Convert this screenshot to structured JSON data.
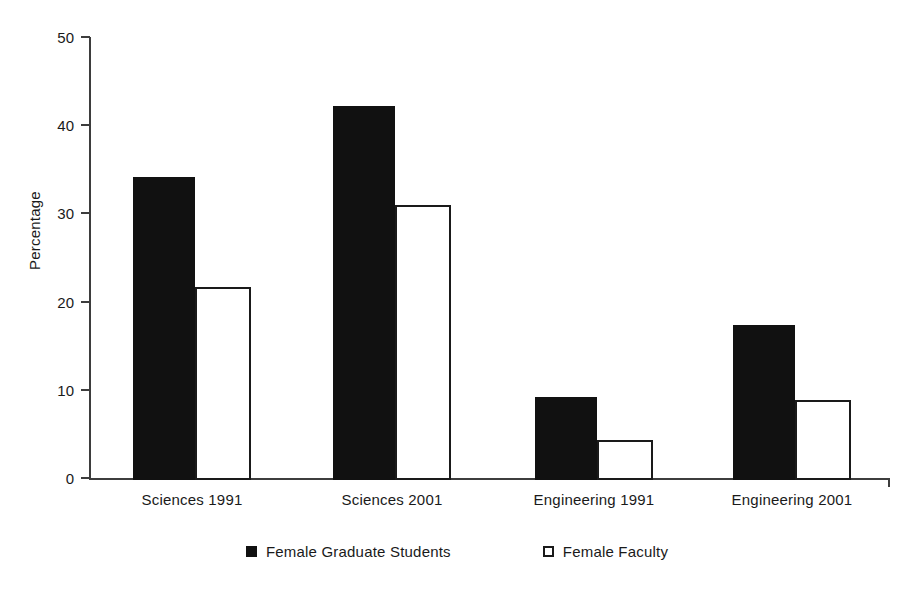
{
  "chart_data": {
    "type": "bar",
    "title": "",
    "xlabel": "",
    "ylabel": "Percentage",
    "ylim": [
      0,
      50
    ],
    "yticks": [
      0,
      10,
      20,
      30,
      40,
      50
    ],
    "grid": false,
    "legend_position": "bottom",
    "categories": [
      "Sciences 1991",
      "Sciences 2001",
      "Engineering 1991",
      "Engineering 2001"
    ],
    "series": [
      {
        "name": "Female Graduate Students",
        "swatch": "filled-black-square",
        "color": "#111111",
        "values": [
          34.1,
          42.2,
          9.2,
          17.4
        ]
      },
      {
        "name": "Female Faculty",
        "swatch": "open-white-square",
        "color": "#ffffff",
        "values": [
          21.7,
          30.9,
          4.3,
          8.8
        ]
      }
    ]
  },
  "axis": {
    "y_title": "Percentage",
    "y_tick_labels": [
      "50",
      "40",
      "30",
      "20",
      "10",
      "0"
    ]
  },
  "legend": {
    "items": [
      {
        "label": "Female Graduate Students"
      },
      {
        "label": "Female Faculty"
      }
    ]
  }
}
